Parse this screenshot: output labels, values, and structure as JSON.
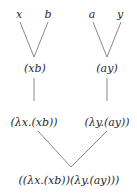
{
  "diagram": {
    "type": "lambda-term parse tree",
    "nodes": {
      "leaf_x": "x",
      "leaf_b": "b",
      "leaf_a": "a",
      "leaf_y": "y",
      "app_xb": "(xb)",
      "app_ay": "(ay)",
      "abs_x": "(λx.(xb))",
      "abs_y": "(λy.(ay))",
      "root": "((λx.(xb))(λy.(ay)))"
    },
    "edges": [
      [
        "leaf_x",
        "app_xb"
      ],
      [
        "leaf_b",
        "app_xb"
      ],
      [
        "leaf_a",
        "app_ay"
      ],
      [
        "leaf_y",
        "app_ay"
      ],
      [
        "app_xb",
        "abs_x"
      ],
      [
        "app_ay",
        "abs_y"
      ],
      [
        "abs_x",
        "root"
      ],
      [
        "abs_y",
        "root"
      ]
    ],
    "colors": {
      "text": "#2a2a2a",
      "edge": "#7a7a7a",
      "background": "#ffffff"
    }
  }
}
